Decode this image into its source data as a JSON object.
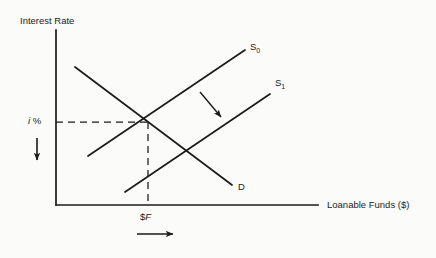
{
  "figure": {
    "background_color": "#fbfbfa",
    "ink_color": "#1b1b1b"
  },
  "axes": {
    "y_label": "Interest Rate",
    "x_label": "Loanable Funds ($)",
    "origin": {
      "x": 56,
      "y": 205
    },
    "y_top": {
      "x": 56,
      "y": 30
    },
    "x_right": {
      "x": 318,
      "y": 205
    }
  },
  "markers": {
    "rate_label_italic": "i",
    "rate_label_unit": " %",
    "funds_label_prefix": "$",
    "funds_label_italic": "F",
    "equilibrium": {
      "x": 148,
      "y": 122
    }
  },
  "curves": [
    {
      "name": "demand",
      "label": "D",
      "x1": 75,
      "y1": 67,
      "x2": 232,
      "y2": 185
    },
    {
      "name": "supply-original",
      "label": "S",
      "subscript": "0",
      "x1": 88,
      "y1": 156,
      "x2": 245,
      "y2": 50
    },
    {
      "name": "supply-shifted",
      "label": "S",
      "subscript": "1",
      "x1": 125,
      "y1": 192,
      "x2": 270,
      "y2": 94
    }
  ],
  "annotations": {
    "shift_arrow": {
      "name": "supply-shift-arrow",
      "x1": 200,
      "y1": 92,
      "x2": 223,
      "y2": 119
    },
    "rate_arrow": {
      "name": "interest-rate-decrease-arrow",
      "x1": 37,
      "y1": 138,
      "x2": 37,
      "y2": 163
    },
    "funds_arrow": {
      "name": "loanable-funds-increase-arrow",
      "x1": 137,
      "y1": 234,
      "x2": 176,
      "y2": 234
    }
  },
  "guides": {
    "horizontal_dashed": {
      "x1": 56,
      "y1": 122,
      "x2": 148,
      "y2": 122
    },
    "vertical_dashed": {
      "x1": 148,
      "y1": 122,
      "x2": 148,
      "y2": 205
    }
  }
}
